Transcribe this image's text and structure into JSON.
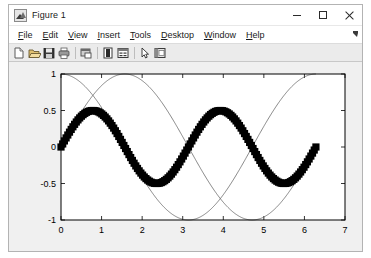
{
  "window": {
    "title": "Figure 1",
    "app_icon": "matlab-figure-icon",
    "controls": {
      "minimize": "–",
      "maximize": "☐",
      "close": "✕"
    }
  },
  "menubar": {
    "items": [
      {
        "label": "File",
        "mnemonic": "F"
      },
      {
        "label": "Edit",
        "mnemonic": "E"
      },
      {
        "label": "View",
        "mnemonic": "V"
      },
      {
        "label": "Insert",
        "mnemonic": "I"
      },
      {
        "label": "Tools",
        "mnemonic": "T"
      },
      {
        "label": "Desktop",
        "mnemonic": "D"
      },
      {
        "label": "Window",
        "mnemonic": "W"
      },
      {
        "label": "Help",
        "mnemonic": "H"
      }
    ],
    "overflow": "menu-overflow-arrow"
  },
  "toolbar": {
    "buttons": [
      {
        "name": "new-figure-icon",
        "tooltip": "New Figure"
      },
      {
        "name": "open-file-icon",
        "tooltip": "Open File"
      },
      {
        "name": "save-figure-icon",
        "tooltip": "Save Figure"
      },
      {
        "name": "print-figure-icon",
        "tooltip": "Print Figure"
      },
      {
        "name": "link-plot-icon",
        "tooltip": "Link Plot"
      },
      {
        "name": "insert-colorbar-icon",
        "tooltip": "Insert Colorbar"
      },
      {
        "name": "insert-legend-icon",
        "tooltip": "Insert Legend"
      },
      {
        "name": "edit-plot-icon",
        "tooltip": "Edit Plot"
      },
      {
        "name": "show-plot-tools-icon",
        "tooltip": "Show Plot Tools and Dock Figure"
      }
    ]
  },
  "chart_data": {
    "type": "line",
    "title": "",
    "xlabel": "",
    "ylabel": "",
    "xlim": [
      0,
      7
    ],
    "ylim": [
      -1,
      1
    ],
    "xticks": [
      0,
      1,
      2,
      3,
      4,
      5,
      6,
      7
    ],
    "yticks": [
      -1,
      -0.5,
      0,
      0.5,
      1
    ],
    "xticklabels": [
      "0",
      "1",
      "2",
      "3",
      "4",
      "5",
      "6",
      "7"
    ],
    "yticklabels": [
      "-1",
      "-0.5",
      "0",
      "0.5",
      "1"
    ],
    "grid": false,
    "legend": null,
    "box": true,
    "background": "#ffffff",
    "series": [
      {
        "name": "0.5*sin(2x)",
        "style": "thick-square-markers",
        "color": "#000000",
        "linewidth": 6,
        "marker": "square",
        "x_range": [
          0,
          6.2832
        ],
        "amplitude": 0.5,
        "frequency": 2,
        "phase": 0,
        "description": "Thick black marker curve, amplitude 0.5, two full periods from 0 to 2pi, peaks near x=0.79 and x=3.93, troughs near x=2.36 and x=5.50"
      },
      {
        "name": "sin(x)",
        "style": "thin-line",
        "color": "#555555",
        "linewidth": 0.7,
        "marker": "none",
        "x_range": [
          0,
          6.2832
        ],
        "amplitude": 1,
        "frequency": 1,
        "phase": 0,
        "description": "Thin curve starting at 0, peak 1 at x=1.57, trough -1 at x=4.71, back to 0 at x=6.28"
      },
      {
        "name": "cos(x)",
        "style": "thin-line",
        "color": "#555555",
        "linewidth": 0.7,
        "marker": "none",
        "x_range": [
          0,
          6.2832
        ],
        "amplitude": 1,
        "frequency": 1,
        "phase": 1.5708,
        "description": "Thin curve starting at 1, trough -1 at x=3.14, back to 1 at x=6.28"
      }
    ]
  }
}
